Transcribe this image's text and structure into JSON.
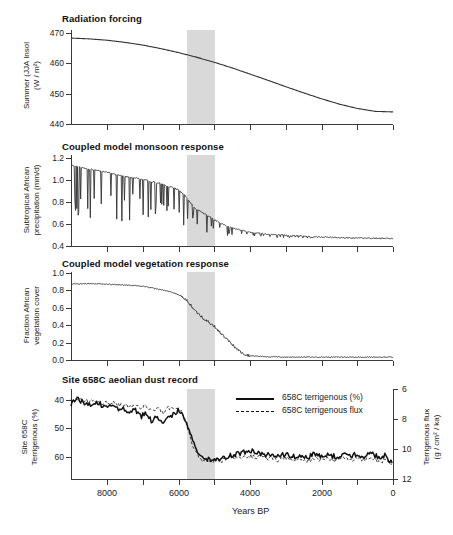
{
  "figure": {
    "xaxis": {
      "title": "Years BP",
      "ticks": [
        8000,
        6000,
        4000,
        2000,
        0
      ],
      "tick_labels": [
        "8000",
        "6000",
        "4000",
        "2000",
        "0"
      ],
      "minor_ticks": [
        9000,
        7000,
        5000,
        3000,
        1000
      ],
      "range": [
        9000,
        0
      ],
      "direction": "reversed"
    },
    "highlight_band": {
      "label": "abrupt transition interval",
      "start": 5700,
      "end": 4800,
      "color": "#d2d2d2"
    },
    "panels": [
      {
        "id": "radiation-forcing",
        "title": "Radiation forcing",
        "ylabel": "Summer (JJA Insol (W / m²)",
        "ylabel_line1": "Summer (JJA Insol",
        "ylabel_line2": "(W / m²)",
        "yticks": [
          470,
          460,
          450,
          440
        ],
        "ytick_labels": [
          "470",
          "460",
          "450",
          "440"
        ],
        "ylim": [
          437,
          472
        ]
      },
      {
        "id": "monsoon-response",
        "title": "Coupled model monsoon response",
        "ylabel": "Subtropical African precipitation (mm/d)",
        "ylabel_line1": "Subtropical African",
        "ylabel_line2": "precipitation (mm/d)",
        "yticks": [
          1.2,
          1.0,
          0.8,
          0.6,
          0.4
        ],
        "ytick_labels": [
          "1.2",
          "1.0",
          "0.8",
          "0.6",
          "0.4"
        ],
        "ylim": [
          0.38,
          1.24
        ]
      },
      {
        "id": "vegetation-response",
        "title": "Coupled model vegetation response",
        "ylabel": "Fraction African vegetation cover",
        "ylabel_line1": "Fraction African",
        "ylabel_line2": "vegetation cover",
        "yticks": [
          1.0,
          0.8,
          0.6,
          0.4,
          0.2,
          0.0
        ],
        "ytick_labels": [
          "1.0",
          "0.8",
          "0.6",
          "0.4",
          "0.2",
          "0.0"
        ],
        "ylim": [
          -0.03,
          1.02
        ]
      },
      {
        "id": "dust-record",
        "title": "Site 658C aeolian dust record",
        "ylabel": "Site 658C Terrigenous (%)",
        "ylabel_line1": "Site 658C",
        "ylabel_line2": "Terrigenous (%)",
        "yticks": [
          40,
          50,
          60
        ],
        "ytick_labels": [
          "40",
          "50",
          "60"
        ],
        "ylim": [
          37,
          65
        ],
        "inverted": true,
        "ylabel_right": "Terrigenous flux (g / cm² / ka)",
        "ylabel_right_line1": "Terrigenous flux",
        "ylabel_right_line2": "(g / cm² / ka)",
        "yticks_right": [
          6,
          8,
          10,
          12
        ],
        "ytick_labels_right": [
          "6",
          "8",
          "10",
          "12"
        ],
        "ylim_right": [
          5.4,
          12.3
        ]
      }
    ],
    "legend": {
      "position": "panel-4-upper-right",
      "items": [
        {
          "label": "658C terrigenous (%)",
          "style": "solid",
          "color": "#111111"
        },
        {
          "label": "658C  terrigenous flux",
          "style": "dashed",
          "color": "#111111"
        }
      ]
    }
  },
  "chart_data": [
    {
      "type": "line",
      "id": "radiation-forcing",
      "title": "Radiation forcing",
      "xlabel": "Years BP",
      "ylabel": "Summer (JJA Insol (W / m²)",
      "xlim": [
        9000,
        0
      ],
      "ylim": [
        437,
        472
      ],
      "grid": false,
      "legend": "none",
      "x": [
        9000,
        8500,
        8000,
        7500,
        7000,
        6500,
        6000,
        5500,
        5000,
        4500,
        4000,
        3500,
        3000,
        2500,
        2000,
        1500,
        1000,
        500,
        0
      ],
      "values": [
        469.0,
        468.7,
        468.2,
        467.4,
        466.4,
        465.1,
        463.6,
        461.9,
        460.0,
        457.9,
        455.6,
        453.3,
        450.9,
        448.6,
        446.4,
        444.4,
        442.8,
        441.7,
        441.5
      ]
    },
    {
      "type": "line",
      "id": "monsoon-response",
      "title": "Coupled model monsoon response",
      "xlabel": "Years BP",
      "ylabel": "Subtropical African precipitation (mm/d)",
      "xlim": [
        9000,
        0
      ],
      "ylim": [
        0.38,
        1.24
      ],
      "grid": false,
      "legend": "none",
      "note": "smooth declining trend with frequent short downward spikes (interannual droughts)",
      "x": [
        9000,
        8750,
        8500,
        8250,
        8000,
        7750,
        7500,
        7250,
        7000,
        6750,
        6500,
        6250,
        6000,
        5900,
        5800,
        5700,
        5600,
        5500,
        5400,
        5300,
        5200,
        5000,
        4800,
        4600,
        4400,
        4200,
        4000,
        3500,
        3000,
        2500,
        2000,
        1500,
        1000,
        500,
        0
      ],
      "values": [
        1.17,
        1.15,
        1.13,
        1.12,
        1.1,
        1.08,
        1.06,
        1.05,
        1.03,
        1.01,
        0.99,
        0.96,
        0.93,
        0.9,
        0.87,
        0.82,
        0.78,
        0.74,
        0.72,
        0.7,
        0.68,
        0.64,
        0.6,
        0.57,
        0.55,
        0.53,
        0.515,
        0.495,
        0.485,
        0.475,
        0.468,
        0.462,
        0.458,
        0.455,
        0.455
      ]
    },
    {
      "type": "line",
      "id": "vegetation-response",
      "title": "Coupled model vegetation response",
      "xlabel": "Years BP",
      "ylabel": "Fraction African vegetation cover",
      "xlim": [
        9000,
        0
      ],
      "ylim": [
        -0.03,
        1.02
      ],
      "grid": false,
      "legend": "none",
      "note": "plateau near 0.89 until ~6000 BP then abrupt collapse to ~0 by ~4200 BP",
      "x": [
        9000,
        8500,
        8000,
        7500,
        7000,
        6800,
        6600,
        6400,
        6200,
        6000,
        5900,
        5800,
        5700,
        5600,
        5500,
        5400,
        5300,
        5200,
        5100,
        5000,
        4900,
        4800,
        4700,
        4600,
        4500,
        4400,
        4300,
        4200,
        4000,
        3500,
        3000,
        2000,
        1000,
        0
      ],
      "values": [
        0.89,
        0.89,
        0.885,
        0.875,
        0.86,
        0.845,
        0.83,
        0.81,
        0.79,
        0.76,
        0.73,
        0.7,
        0.66,
        0.6,
        0.55,
        0.52,
        0.47,
        0.45,
        0.4,
        0.38,
        0.33,
        0.29,
        0.24,
        0.2,
        0.16,
        0.12,
        0.08,
        0.05,
        0.02,
        0.01,
        0.005,
        0.005,
        0.005,
        0.005
      ]
    },
    {
      "type": "line",
      "id": "dust-record",
      "title": "Site 658C aeolian dust record",
      "xlabel": "Years BP",
      "ylabel": "Site 658C Terrigenous (%)",
      "ylabel_right": "Terrigenous flux (g / cm² / ka)",
      "xlim": [
        9000,
        0
      ],
      "ylim": [
        37,
        65
      ],
      "y_inverted": true,
      "ylim_right": [
        5.4,
        12.3
      ],
      "grid": false,
      "legend": "upper-right",
      "x": [
        9000,
        8850,
        8700,
        8550,
        8400,
        8250,
        8100,
        7950,
        7800,
        7650,
        7500,
        7350,
        7200,
        7050,
        6900,
        6750,
        6600,
        6450,
        6300,
        6150,
        6000,
        5900,
        5800,
        5700,
        5600,
        5500,
        5400,
        5300,
        5200,
        5100,
        5000,
        4900,
        4800,
        4700,
        4600,
        4400,
        4200,
        4000,
        3800,
        3600,
        3400,
        3200,
        3000,
        2800,
        2600,
        2400,
        2200,
        2000,
        1800,
        1600,
        1400,
        1200,
        1000,
        800,
        600,
        400,
        200,
        100,
        0
      ],
      "series": [
        {
          "name": "658C terrigenous (%)",
          "style": "solid",
          "values": [
            41.5,
            39.5,
            40.5,
            41.0,
            41.5,
            41.0,
            42.0,
            42.5,
            42.0,
            43.5,
            43.0,
            44.5,
            43.5,
            46.0,
            44.5,
            47.5,
            45.0,
            48.5,
            46.0,
            45.0,
            43.5,
            44.5,
            47.0,
            51.0,
            54.5,
            57.5,
            59.5,
            60.5,
            60.5,
            60.8,
            61.0,
            60.5,
            60.8,
            60.0,
            59.5,
            59.0,
            58.5,
            57.5,
            58.8,
            59.5,
            59.0,
            60.0,
            58.8,
            60.0,
            59.3,
            60.3,
            59.0,
            59.8,
            59.3,
            60.0,
            59.0,
            59.8,
            59.0,
            60.0,
            58.8,
            60.0,
            59.5,
            61.0,
            62.8
          ]
        },
        {
          "name": "658C  terrigenous flux",
          "style": "dashed",
          "values": [
            40.5,
            40.0,
            39.8,
            40.3,
            40.8,
            40.5,
            41.0,
            41.3,
            41.0,
            42.0,
            41.5,
            42.5,
            41.8,
            43.0,
            42.0,
            44.0,
            42.5,
            44.5,
            43.0,
            42.5,
            42.8,
            44.0,
            47.5,
            52.0,
            55.5,
            58.5,
            60.5,
            61.5,
            61.5,
            61.8,
            61.5,
            61.0,
            61.3,
            60.8,
            60.3,
            60.0,
            60.0,
            59.5,
            60.0,
            60.5,
            60.3,
            61.0,
            60.3,
            61.0,
            60.5,
            61.3,
            60.5,
            61.0,
            60.5,
            61.3,
            60.5,
            61.3,
            60.3,
            61.0,
            60.3,
            61.5,
            61.3,
            61.8,
            62.0
          ]
        }
      ]
    }
  ]
}
